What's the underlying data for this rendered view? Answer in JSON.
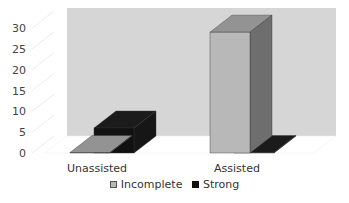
{
  "chart_data": {
    "type": "bar",
    "style": "3d-clustered-column",
    "title": "",
    "xlabel": "",
    "ylabel": "",
    "categories": [
      "Unassisted",
      "Assisted"
    ],
    "series": [
      {
        "name": "Incomplete",
        "values": [
          0,
          29
        ],
        "color": "#b8b8b8"
      },
      {
        "name": "Strong",
        "values": [
          6,
          0
        ],
        "color": "#111111"
      }
    ],
    "yticks": [
      0,
      5,
      10,
      15,
      20,
      25,
      30
    ],
    "ylim": [
      0,
      30
    ],
    "grid": false,
    "legend_position": "bottom",
    "back_wall_color": "#d6d6d6"
  },
  "legend": {
    "items": [
      {
        "label": "Incomplete",
        "color": "#b8b8b8"
      },
      {
        "label": "Strong",
        "color": "#111111"
      }
    ]
  }
}
